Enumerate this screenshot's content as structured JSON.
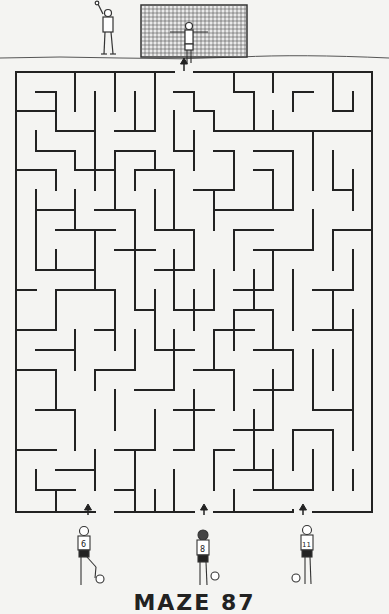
{
  "puzzle": {
    "title": "MAZE 87",
    "entrance_marker": "↑",
    "goal": "goal-net",
    "starts": [
      {
        "label": "player-6",
        "jersey_number": "6",
        "x": 95
      },
      {
        "label": "player-8",
        "jersey_number": "8",
        "x": 204
      },
      {
        "label": "player-11",
        "jersey_number": "11",
        "x": 303
      }
    ]
  },
  "colors": {
    "background": "#f4f4f2",
    "wall": "#222222",
    "ink": "#333333"
  },
  "grid": {
    "left": 16,
    "top": 72,
    "right": 372,
    "bottom": 512,
    "cols": 18,
    "rows": 22
  },
  "walls": [
    [
      16,
      72,
      174,
      72
    ],
    [
      194,
      72,
      372,
      72
    ],
    [
      16,
      72,
      16,
      512
    ],
    [
      372,
      72,
      372,
      512
    ],
    [
      16,
      512,
      95,
      512
    ],
    [
      115,
      512,
      194,
      512
    ],
    [
      214,
      512,
      293,
      512
    ],
    [
      313,
      512,
      372,
      512
    ],
    [
      75,
      72,
      75,
      111
    ],
    [
      115,
      72,
      115,
      111
    ],
    [
      155,
      72,
      155,
      131
    ],
    [
      234,
      72,
      234,
      92
    ],
    [
      273,
      72,
      273,
      92
    ],
    [
      36,
      92,
      56,
      92
    ],
    [
      56,
      92,
      56,
      131
    ],
    [
      16,
      111,
      56,
      111
    ],
    [
      95,
      92,
      95,
      190
    ],
    [
      56,
      131,
      95,
      131
    ],
    [
      135,
      92,
      135,
      131
    ],
    [
      115,
      131,
      155,
      131
    ],
    [
      174,
      92,
      194,
      92
    ],
    [
      194,
      92,
      194,
      111
    ],
    [
      194,
      111,
      214,
      111
    ],
    [
      214,
      111,
      214,
      131
    ],
    [
      234,
      92,
      254,
      92
    ],
    [
      254,
      92,
      254,
      131
    ],
    [
      293,
      92,
      313,
      92
    ],
    [
      293,
      92,
      293,
      111
    ],
    [
      333,
      72,
      333,
      111
    ],
    [
      333,
      111,
      353,
      111
    ],
    [
      353,
      92,
      353,
      111
    ],
    [
      273,
      111,
      273,
      131
    ],
    [
      214,
      131,
      273,
      131
    ],
    [
      273,
      131,
      372,
      131
    ],
    [
      36,
      131,
      36,
      151
    ],
    [
      36,
      151,
      75,
      151
    ],
    [
      75,
      151,
      75,
      170
    ],
    [
      115,
      151,
      155,
      151
    ],
    [
      115,
      151,
      115,
      170
    ],
    [
      155,
      151,
      155,
      170
    ],
    [
      174,
      111,
      174,
      151
    ],
    [
      174,
      151,
      194,
      151
    ],
    [
      194,
      131,
      194,
      170
    ],
    [
      214,
      151,
      234,
      151
    ],
    [
      234,
      151,
      234,
      190
    ],
    [
      254,
      151,
      293,
      151
    ],
    [
      293,
      151,
      293,
      210
    ],
    [
      313,
      131,
      313,
      190
    ],
    [
      333,
      151,
      333,
      190
    ],
    [
      333,
      190,
      353,
      190
    ],
    [
      353,
      170,
      353,
      210
    ],
    [
      16,
      170,
      56,
      170
    ],
    [
      56,
      170,
      56,
      190
    ],
    [
      75,
      170,
      115,
      170
    ],
    [
      115,
      170,
      115,
      210
    ],
    [
      135,
      170,
      174,
      170
    ],
    [
      135,
      170,
      135,
      190
    ],
    [
      174,
      170,
      174,
      230
    ],
    [
      194,
      190,
      234,
      190
    ],
    [
      254,
      170,
      273,
      170
    ],
    [
      273,
      170,
      273,
      210
    ],
    [
      214,
      210,
      293,
      210
    ],
    [
      214,
      190,
      214,
      230
    ],
    [
      36,
      190,
      36,
      270
    ],
    [
      36,
      210,
      75,
      210
    ],
    [
      75,
      190,
      75,
      230
    ],
    [
      95,
      210,
      135,
      210
    ],
    [
      135,
      210,
      135,
      250
    ],
    [
      155,
      190,
      155,
      230
    ],
    [
      155,
      230,
      194,
      230
    ],
    [
      194,
      230,
      194,
      270
    ],
    [
      234,
      230,
      273,
      230
    ],
    [
      234,
      230,
      234,
      270
    ],
    [
      254,
      250,
      313,
      250
    ],
    [
      313,
      210,
      313,
      250
    ],
    [
      333,
      230,
      372,
      230
    ],
    [
      333,
      230,
      333,
      270
    ],
    [
      353,
      250,
      353,
      290
    ],
    [
      56,
      230,
      115,
      230
    ],
    [
      95,
      230,
      95,
      290
    ],
    [
      56,
      250,
      56,
      270
    ],
    [
      36,
      270,
      95,
      270
    ],
    [
      115,
      250,
      155,
      250
    ],
    [
      135,
      250,
      135,
      310
    ],
    [
      174,
      250,
      174,
      310
    ],
    [
      155,
      270,
      194,
      270
    ],
    [
      214,
      270,
      214,
      310
    ],
    [
      234,
      290,
      273,
      290
    ],
    [
      254,
      270,
      254,
      310
    ],
    [
      273,
      250,
      273,
      290
    ],
    [
      293,
      270,
      293,
      330
    ],
    [
      313,
      290,
      353,
      290
    ],
    [
      333,
      290,
      333,
      330
    ],
    [
      16,
      290,
      36,
      290
    ],
    [
      56,
      290,
      115,
      290
    ],
    [
      56,
      290,
      56,
      330
    ],
    [
      115,
      290,
      115,
      350
    ],
    [
      135,
      310,
      155,
      310
    ],
    [
      155,
      290,
      155,
      350
    ],
    [
      174,
      310,
      214,
      310
    ],
    [
      194,
      290,
      194,
      330
    ],
    [
      234,
      310,
      273,
      310
    ],
    [
      234,
      310,
      234,
      350
    ],
    [
      273,
      310,
      273,
      350
    ],
    [
      313,
      330,
      353,
      330
    ],
    [
      16,
      330,
      56,
      330
    ],
    [
      36,
      350,
      75,
      350
    ],
    [
      75,
      330,
      75,
      370
    ],
    [
      95,
      330,
      115,
      330
    ],
    [
      135,
      330,
      135,
      370
    ],
    [
      155,
      350,
      194,
      350
    ],
    [
      174,
      330,
      174,
      390
    ],
    [
      214,
      330,
      254,
      330
    ],
    [
      214,
      330,
      214,
      370
    ],
    [
      254,
      350,
      293,
      350
    ],
    [
      293,
      350,
      293,
      390
    ],
    [
      313,
      350,
      313,
      410
    ],
    [
      333,
      350,
      333,
      390
    ],
    [
      353,
      310,
      353,
      450
    ],
    [
      16,
      370,
      56,
      370
    ],
    [
      56,
      370,
      56,
      410
    ],
    [
      95,
      370,
      135,
      370
    ],
    [
      95,
      370,
      95,
      390
    ],
    [
      135,
      390,
      174,
      390
    ],
    [
      194,
      370,
      234,
      370
    ],
    [
      234,
      370,
      234,
      410
    ],
    [
      254,
      390,
      293,
      390
    ],
    [
      273,
      370,
      273,
      430
    ],
    [
      313,
      410,
      353,
      410
    ],
    [
      36,
      410,
      75,
      410
    ],
    [
      75,
      410,
      75,
      450
    ],
    [
      115,
      390,
      115,
      430
    ],
    [
      155,
      410,
      155,
      450
    ],
    [
      174,
      410,
      214,
      410
    ],
    [
      194,
      390,
      194,
      450
    ],
    [
      234,
      430,
      273,
      430
    ],
    [
      254,
      410,
      254,
      470
    ],
    [
      293,
      430,
      333,
      430
    ],
    [
      293,
      430,
      293,
      470
    ],
    [
      333,
      430,
      333,
      490
    ],
    [
      16,
      450,
      56,
      450
    ],
    [
      36,
      470,
      36,
      490
    ],
    [
      56,
      470,
      95,
      470
    ],
    [
      95,
      450,
      95,
      490
    ],
    [
      115,
      450,
      155,
      450
    ],
    [
      135,
      450,
      135,
      512
    ],
    [
      174,
      450,
      194,
      450
    ],
    [
      174,
      470,
      174,
      512
    ],
    [
      214,
      450,
      234,
      450
    ],
    [
      214,
      450,
      214,
      490
    ],
    [
      234,
      470,
      273,
      470
    ],
    [
      273,
      450,
      273,
      490
    ],
    [
      254,
      490,
      313,
      490
    ],
    [
      313,
      450,
      313,
      490
    ],
    [
      353,
      470,
      353,
      490
    ],
    [
      36,
      490,
      75,
      490
    ],
    [
      56,
      490,
      56,
      512
    ],
    [
      115,
      490,
      135,
      490
    ],
    [
      155,
      490,
      155,
      512
    ],
    [
      234,
      490,
      234,
      512
    ],
    [
      293,
      510,
      293,
      512
    ]
  ]
}
